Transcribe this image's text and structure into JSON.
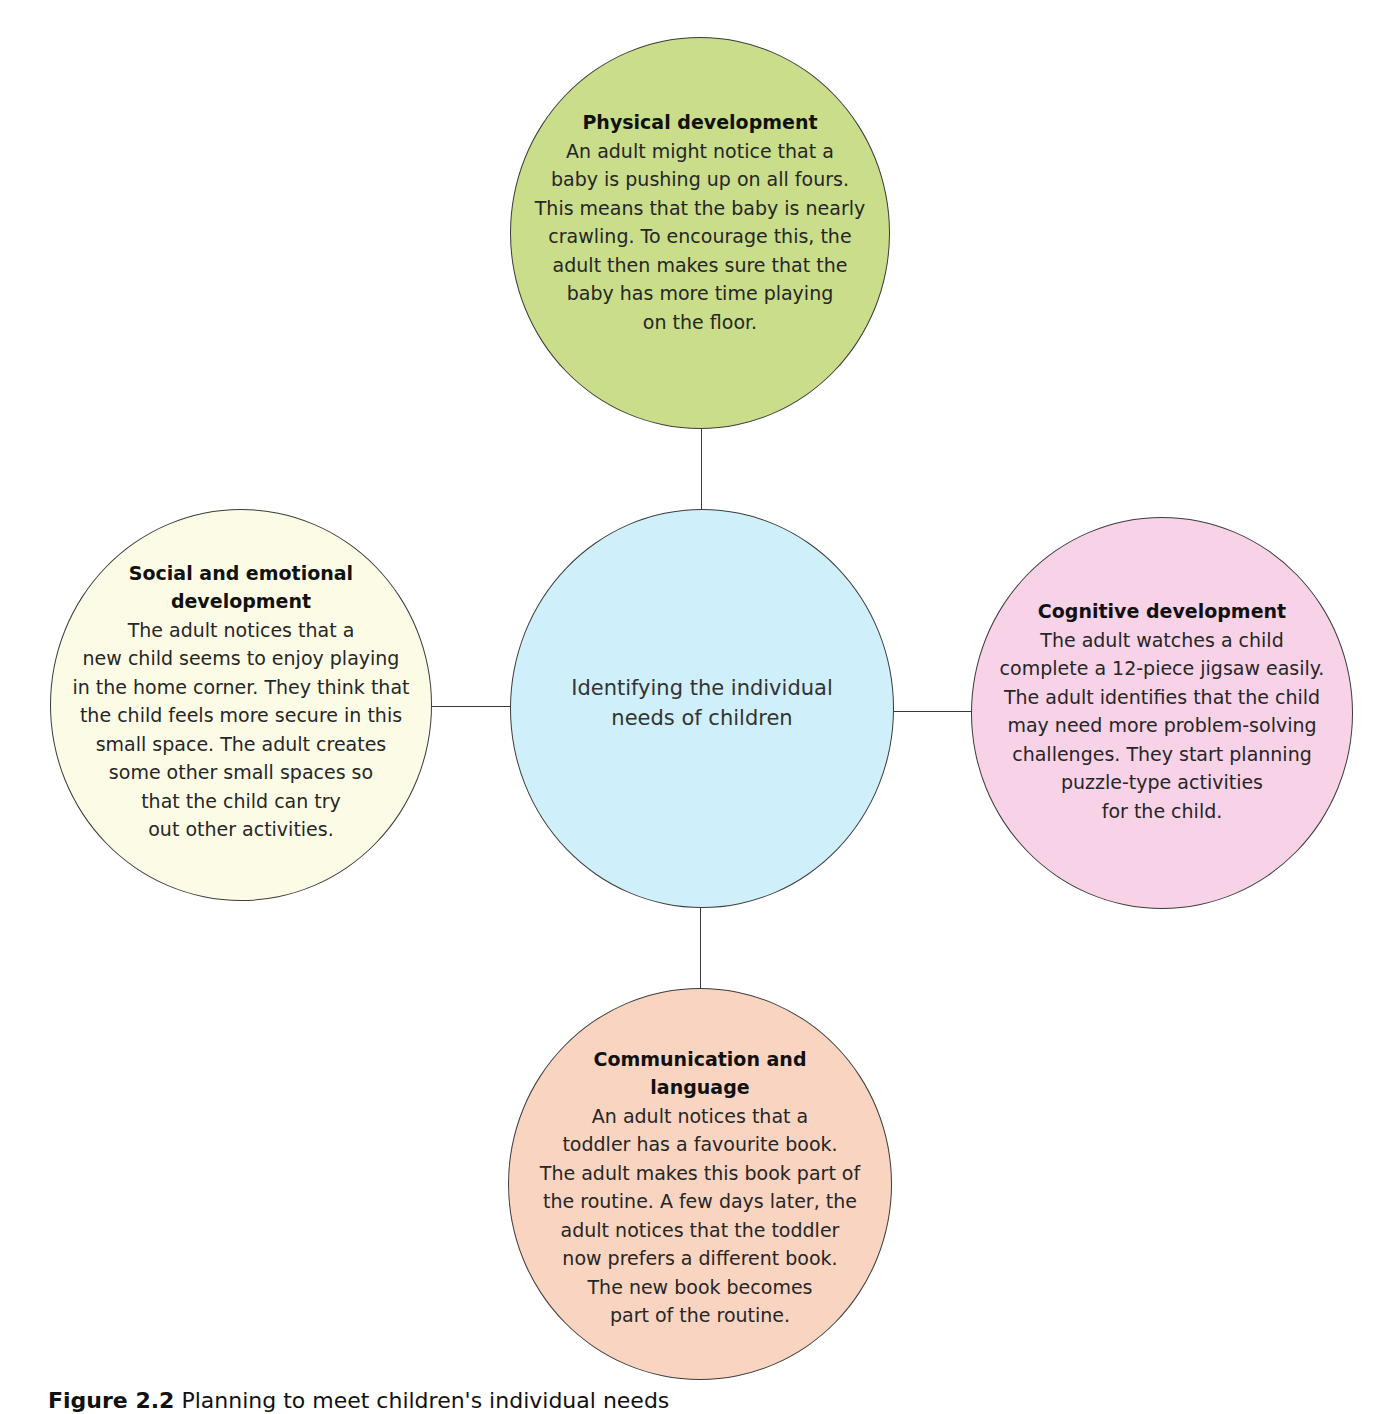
{
  "diagram": {
    "type": "hub-and-spoke concept map",
    "center": {
      "lines": [
        "Identifying the individual",
        "needs of children"
      ],
      "color": "#cff0fa"
    },
    "nodes": {
      "top": {
        "title_lines": [
          "Physical development"
        ],
        "body_lines": [
          "An adult might notice that a",
          "baby is pushing up on all fours.",
          "This means that the baby is nearly",
          "crawling. To encourage this, the",
          "adult then makes sure that the",
          "baby has more time playing",
          "on the floor."
        ],
        "color": "#c9dd8a"
      },
      "left": {
        "title_lines": [
          "Social and emotional",
          "development"
        ],
        "body_lines": [
          "The adult notices that a",
          "new child seems to enjoy playing",
          "in the home corner. They think that",
          "the child feels more secure in this",
          "small space. The adult creates",
          "some other small spaces so",
          "that the child can try",
          "out other activities."
        ],
        "color": "#fcfce6"
      },
      "right": {
        "title_lines": [
          "Cognitive development"
        ],
        "body_lines": [
          "The adult watches a child",
          "complete a 12-piece jigsaw easily.",
          "The adult identifies that the child",
          "may need more problem-solving",
          "challenges. They start planning",
          "puzzle-type activities",
          "for the child."
        ],
        "color": "#f8d2e6"
      },
      "bottom": {
        "title_lines": [
          "Communication and",
          "language"
        ],
        "body_lines": [
          "An adult notices that a",
          "toddler has a favourite book.",
          "The adult makes this book part of",
          "the routine. A few days later, the",
          "adult notices that the toddler",
          "now prefers a different book.",
          "The new book becomes",
          "part of the routine."
        ],
        "color": "#f9d4c0"
      }
    },
    "border_color": "#3c3c3c"
  },
  "caption": {
    "label": "Figure 2.2",
    "text": "Planning to meet children's individual needs"
  }
}
